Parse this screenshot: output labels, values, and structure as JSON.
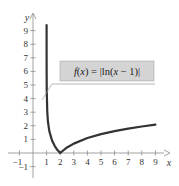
{
  "chart_data": {
    "type": "line",
    "title": "",
    "annotation": "f(x) = |ln(x − 1)|",
    "annotation_parts": {
      "fx": "f",
      "lp": "(",
      "x": "x",
      "rp": ")",
      "eq": " = |ln(",
      "x2": "x",
      "rest": " − 1)|"
    },
    "xlabel": "x",
    "ylabel": "y",
    "xlim": [
      -1.5,
      10
    ],
    "ylim": [
      -1.8,
      10
    ],
    "xticks": [
      -1,
      1,
      2,
      3,
      4,
      5,
      6,
      7,
      8,
      9
    ],
    "yticks": [
      -1,
      1,
      2,
      3,
      4,
      5,
      6,
      7,
      8,
      9
    ],
    "xtick_labels": [
      "−1",
      "1",
      "2",
      "3",
      "4",
      "5",
      "6",
      "7",
      "8",
      "9"
    ],
    "ytick_labels": [
      "−1",
      "1",
      "2",
      "3",
      "4",
      "5",
      "6",
      "7",
      "8",
      "9"
    ],
    "grid": false,
    "series": [
      {
        "name": "f(x) = |ln(x − 1)|",
        "color": "#333333",
        "x": [
          1.00008,
          1.0002,
          1.0005,
          1.001,
          1.003,
          1.01,
          1.05,
          1.1,
          1.2,
          1.4,
          1.6,
          1.8,
          2,
          2.5,
          3,
          4,
          5,
          6,
          7,
          8,
          9
        ],
        "y": [
          9.4,
          8.5,
          7.6,
          6.9,
          5.8,
          4.61,
          3.0,
          2.3,
          1.61,
          0.92,
          0.51,
          0.22,
          0,
          0.41,
          0.69,
          1.1,
          1.39,
          1.61,
          1.79,
          1.95,
          2.08
        ]
      }
    ]
  },
  "colors": {
    "curve": "#333333",
    "axis": "#8a8a8a",
    "label_box": "#d4d4d4",
    "label_border": "#9a9a9a"
  }
}
